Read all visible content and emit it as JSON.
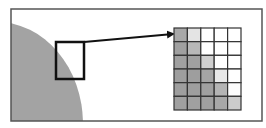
{
  "diagram": {
    "frame": {
      "x": 11,
      "y": 9,
      "width": 251,
      "height": 112,
      "stroke": "#555555"
    },
    "shape": {
      "fill": "#a3a3a3",
      "cx": -3,
      "cy": 124,
      "rx": 86,
      "ry": 102
    },
    "selection_box": {
      "x": 56,
      "y": 42,
      "width": 28,
      "height": 37,
      "stroke": "#111111"
    },
    "arrow": {
      "x1": 84,
      "y1": 42,
      "x2": 173,
      "y2": 34,
      "stroke": "#111111"
    },
    "grid": {
      "x": 174,
      "y": 28,
      "width": 67,
      "height": 82,
      "cols": 5,
      "rows": 6,
      "line_color": "#333333",
      "cells": [
        [
          "#a8a8a8",
          "#e4e4e4",
          "#ffffff",
          "#ffffff",
          "#ffffff"
        ],
        [
          "#a0a0a0",
          "#b8b8b8",
          "#ffffff",
          "#ffffff",
          "#ffffff"
        ],
        [
          "#a0a0a0",
          "#a0a0a0",
          "#cfcfcf",
          "#ffffff",
          "#ffffff"
        ],
        [
          "#9e9e9e",
          "#9e9e9e",
          "#a4a4a4",
          "#e8e8e8",
          "#ffffff"
        ],
        [
          "#9e9e9e",
          "#9e9e9e",
          "#a0a0a0",
          "#b4b4b4",
          "#fcfcfc"
        ],
        [
          "#a0a0a0",
          "#a0a0a0",
          "#a0a0a0",
          "#a8a8a8",
          "#cccccc"
        ]
      ]
    }
  }
}
